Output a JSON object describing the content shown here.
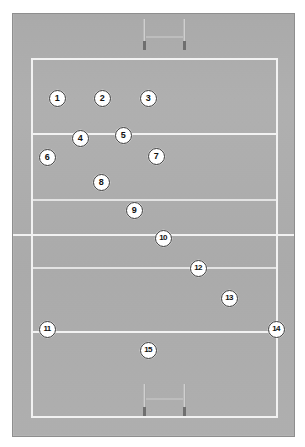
{
  "diagram": {
    "surface_label": "rugby-pitch",
    "colors": {
      "page_background": "#ffffff",
      "field": "#b2b2b2",
      "frame_border": "#8e8e8e",
      "pitch_line": "#f2f2f2",
      "pitch_line_faint": "#e3e3e3",
      "post_upright": "#cfcfcf",
      "post_padding": "#6f6f6f",
      "marker_fill": "#ffffff",
      "marker_border": "#3a3a3a",
      "marker_text": "#111111"
    }
  },
  "pitch": {
    "lines": [
      {
        "name": "try-line-top",
        "orientation": "h",
        "left": 18,
        "top": 44,
        "length": 247,
        "thickness": 2,
        "faint": false
      },
      {
        "name": "twenty-two-line-top",
        "orientation": "h",
        "left": 18,
        "top": 119,
        "length": 247,
        "thickness": 2,
        "faint": false
      },
      {
        "name": "ten-metre-line-top",
        "orientation": "h",
        "left": 18,
        "top": 185,
        "length": 247,
        "thickness": 2,
        "faint": true
      },
      {
        "name": "halfway-line",
        "orientation": "h",
        "left": 0,
        "top": 220,
        "length": 281,
        "thickness": 2,
        "faint": false
      },
      {
        "name": "ten-metre-line-bottom",
        "orientation": "h",
        "left": 18,
        "top": 253,
        "length": 247,
        "thickness": 2,
        "faint": true
      },
      {
        "name": "twenty-two-line-bottom",
        "orientation": "h",
        "left": 18,
        "top": 317,
        "length": 247,
        "thickness": 2,
        "faint": false
      },
      {
        "name": "try-line-bottom",
        "orientation": "h",
        "left": 18,
        "top": 402,
        "length": 247,
        "thickness": 2,
        "faint": false
      },
      {
        "name": "touch-line-left",
        "orientation": "v",
        "left": 18,
        "top": 44,
        "length": 360,
        "thickness": 2,
        "faint": false
      },
      {
        "name": "touch-line-right",
        "orientation": "v",
        "left": 263,
        "top": 44,
        "length": 360,
        "thickness": 2,
        "faint": false
      }
    ],
    "goal_posts": [
      {
        "name": "goal-posts-top",
        "left": 122,
        "top": 5,
        "width": 60,
        "height": 38,
        "upright_left_x": 8,
        "upright_right_x": 48,
        "upright_top": 0,
        "upright_height": 30,
        "padding_top": 22,
        "padding_height": 9,
        "crossbar_y": 17,
        "crossbar_left": 9,
        "crossbar_width": 40
      },
      {
        "name": "goal-posts-bottom",
        "left": 122,
        "top": 368,
        "width": 60,
        "height": 38,
        "upright_left_x": 8,
        "upright_right_x": 48,
        "upright_top": 2,
        "upright_height": 32,
        "padding_top": 25,
        "padding_height": 9,
        "crossbar_y": 16,
        "crossbar_left": 9,
        "crossbar_width": 40
      }
    ]
  },
  "players": [
    {
      "number": "1",
      "name": "player-marker-1",
      "x": 44,
      "y": 84
    },
    {
      "number": "2",
      "name": "player-marker-2",
      "x": 89,
      "y": 84
    },
    {
      "number": "3",
      "name": "player-marker-3",
      "x": 135,
      "y": 84
    },
    {
      "number": "4",
      "name": "player-marker-4",
      "x": 67,
      "y": 124
    },
    {
      "number": "5",
      "name": "player-marker-5",
      "x": 110,
      "y": 121
    },
    {
      "number": "6",
      "name": "player-marker-6",
      "x": 34,
      "y": 143
    },
    {
      "number": "7",
      "name": "player-marker-7",
      "x": 143,
      "y": 142
    },
    {
      "number": "8",
      "name": "player-marker-8",
      "x": 88,
      "y": 168
    },
    {
      "number": "9",
      "name": "player-marker-9",
      "x": 121,
      "y": 196
    },
    {
      "number": "10",
      "name": "player-marker-10",
      "x": 150,
      "y": 224
    },
    {
      "number": "11",
      "name": "player-marker-11",
      "x": 34,
      "y": 315
    },
    {
      "number": "12",
      "name": "player-marker-12",
      "x": 185,
      "y": 254
    },
    {
      "number": "13",
      "name": "player-marker-13",
      "x": 216,
      "y": 284
    },
    {
      "number": "14",
      "name": "player-marker-14",
      "x": 263,
      "y": 315
    },
    {
      "number": "15",
      "name": "player-marker-15",
      "x": 135,
      "y": 336
    }
  ]
}
